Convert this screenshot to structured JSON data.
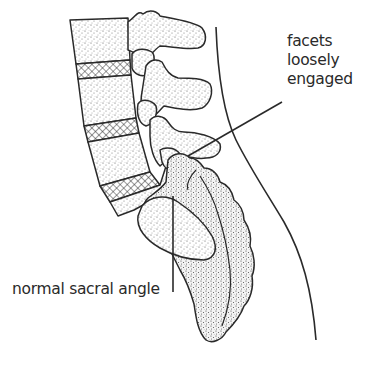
{
  "diagram": {
    "labels": {
      "facets": [
        "facets",
        "loosely",
        "engaged"
      ],
      "sacral_angle": "normal sacral angle"
    },
    "structures": [
      "lumbar-vertebral-body",
      "intervertebral-disc",
      "facet-joint",
      "sacrum",
      "coccyx",
      "body-outline"
    ],
    "colors": {
      "ink": "#2a2a2a",
      "stipple": "#555555",
      "background": "#ffffff"
    }
  }
}
